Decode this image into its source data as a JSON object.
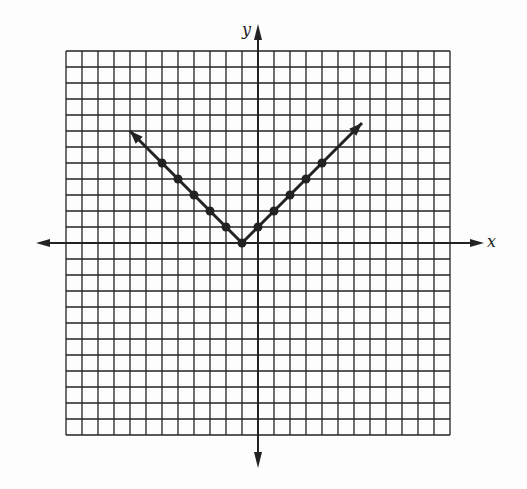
{
  "chart_data": {
    "type": "line",
    "title": "",
    "xlabel": "x",
    "ylabel": "y",
    "xlim": [
      -12,
      12
    ],
    "ylim": [
      -12,
      12
    ],
    "grid": true,
    "legend": null,
    "series": [
      {
        "name": "y = |x + 1|",
        "x": [
          -8,
          -6,
          -5,
          -4,
          -3,
          -2,
          -1,
          0,
          1,
          2,
          3,
          4,
          5,
          6.5
        ],
        "y": [
          7,
          5,
          4,
          3,
          2,
          1,
          0,
          1,
          2,
          3,
          4,
          5,
          6,
          7.5
        ],
        "points": [
          [
            -6,
            5
          ],
          [
            -5,
            4
          ],
          [
            -4,
            3
          ],
          [
            -3,
            2
          ],
          [
            -2,
            1
          ],
          [
            -1,
            0
          ],
          [
            0,
            1
          ],
          [
            1,
            2
          ],
          [
            2,
            3
          ],
          [
            3,
            4
          ],
          [
            4,
            5
          ]
        ],
        "arrows": "both ends"
      }
    ]
  },
  "labels": {
    "x_axis": "x",
    "y_axis": "y"
  },
  "colors": {
    "line": "#222222",
    "grid": "#222222",
    "background": "#fdfdfd"
  }
}
